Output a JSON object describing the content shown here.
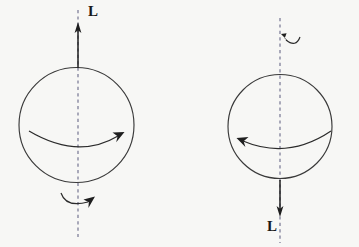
{
  "figure": {
    "background_color": "#f7f7f5",
    "stroke_color": "#2b2b2b",
    "dash_color": "#5a5a7a",
    "panels": [
      {
        "id": "left",
        "name": "counterclockwise-top-view-sphere",
        "circle": {
          "cx": 76.5,
          "cy": 125,
          "r": 57.5
        },
        "axis": {
          "x": 78,
          "y_top": 10,
          "y_bottom": 237,
          "style": "dashed"
        },
        "angular_momentum_vector": {
          "label": "L",
          "direction": "up",
          "tail_y": 68,
          "tip_y": 24,
          "label_x": 88,
          "label_y": 4
        },
        "equator_arc": {
          "name": "spin-arrow-equator",
          "direction": "left-to-right",
          "arrowhead_at": "right"
        },
        "base_arc": {
          "name": "spin-arrow-base",
          "direction": "left-to-right",
          "arrowhead_at": "right"
        }
      },
      {
        "id": "right",
        "name": "clockwise-top-view-sphere",
        "circle": {
          "cx": 280,
          "cy": 126.5,
          "r": 52
        },
        "axis": {
          "x": 280,
          "y_top": 18,
          "y_bottom": 243,
          "style": "dashed"
        },
        "angular_momentum_vector": {
          "label": "L",
          "direction": "down",
          "tail_y": 180,
          "tip_y": 216,
          "label_x": 267,
          "label_y": 219
        },
        "equator_arc": {
          "name": "spin-arrow-equator",
          "direction": "right-to-left",
          "arrowhead_at": "left"
        },
        "top_arc": {
          "name": "spin-arrow-top",
          "direction": "right-to-left",
          "arrowhead_at": "left"
        }
      }
    ],
    "labels": {
      "left_vector": "L",
      "right_vector": "L"
    }
  }
}
